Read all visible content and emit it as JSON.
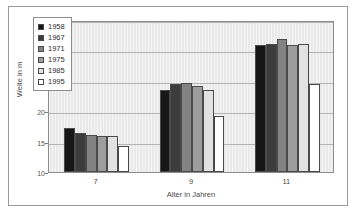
{
  "chart_data": {
    "type": "bar",
    "title": "",
    "subtitle": "",
    "xlabel": "Alter in Jahren",
    "ylabel": "Weite in m",
    "categories": [
      "7",
      "9",
      "11"
    ],
    "ylim": [
      10,
      35
    ],
    "yticks": [
      10,
      15,
      20,
      25,
      30,
      35
    ],
    "ytick_labels": [
      "10",
      "15",
      "20",
      "25",
      "30",
      "35"
    ],
    "grid": true,
    "legend_position": "upper-left-inside",
    "series": [
      {
        "name": "1958",
        "color": "#161616",
        "values": [
          17.2,
          23.5,
          30.9
        ]
      },
      {
        "name": "1967",
        "color": "#3c3c3c",
        "values": [
          16.4,
          24.4,
          31.0
        ]
      },
      {
        "name": "1971",
        "color": "#828282",
        "values": [
          16.1,
          24.7,
          31.9
        ]
      },
      {
        "name": "1975",
        "color": "#9d9d9d",
        "values": [
          15.9,
          24.1,
          30.9
        ]
      },
      {
        "name": "1985",
        "color": "#e2e2e2",
        "values": [
          16.0,
          23.5,
          31.0
        ]
      },
      {
        "name": "1995",
        "color": "#ffffff",
        "values": [
          14.2,
          19.2,
          24.5
        ]
      }
    ]
  },
  "frame": {
    "border_color": "#9a9a9a",
    "plot_background": "#e9e9e9"
  }
}
